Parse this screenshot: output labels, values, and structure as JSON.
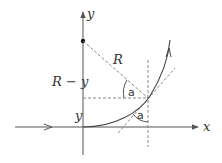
{
  "diagram": {
    "labels": {
      "y_axis": "y",
      "x_axis": "x",
      "radius": "R",
      "r_minus_y": "R − y",
      "y_height": "y",
      "angle_top": "a",
      "angle_bottom": "a"
    },
    "colors": {
      "stroke": "#444444",
      "dashed": "#888888",
      "background": "#ffffff"
    }
  }
}
